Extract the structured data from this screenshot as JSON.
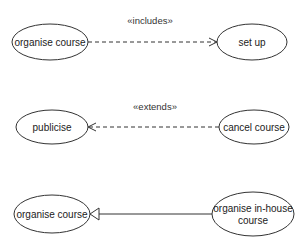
{
  "diagram": {
    "type": "uml-use-case",
    "colors": {
      "stroke": "#333333",
      "fill": "#ffffff",
      "text": "#222222"
    },
    "relationships": [
      {
        "kind": "include",
        "stereotype": "«includes»",
        "from": {
          "label": "organise course"
        },
        "to": {
          "label": "set up"
        }
      },
      {
        "kind": "extend",
        "stereotype": "«extends»",
        "from": {
          "label": "cancel course"
        },
        "to": {
          "label": "publicise"
        }
      },
      {
        "kind": "generalization",
        "stereotype": "",
        "from": {
          "label_line1": "organise in-house",
          "label_line2": "course"
        },
        "to": {
          "label": "organise course"
        }
      }
    ]
  }
}
